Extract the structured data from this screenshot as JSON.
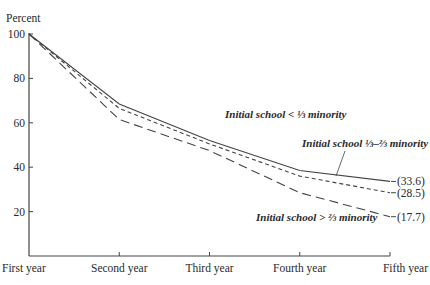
{
  "chart_data": {
    "type": "line",
    "title": "",
    "xlabel": "",
    "ylabel": "Percent",
    "ylim": [
      0,
      100
    ],
    "yticks": [
      20,
      40,
      60,
      80,
      100
    ],
    "ytick_labels": [
      "20",
      "40",
      "60",
      "80",
      "100"
    ],
    "grid": false,
    "categories": [
      "First year",
      "Second year",
      "Third year",
      "Fourth year",
      "Fifth year"
    ],
    "series": [
      {
        "name": "Initial school < 1/3 minority",
        "label": "Initial school < ⅓ minority",
        "style": "solid",
        "values": [
          100,
          68.5,
          52,
          38.5,
          33.6
        ],
        "end_label": "(33.6)"
      },
      {
        "name": "Initial school 1/3–2/3 minority",
        "label": "Initial school ⅓–⅔ minority",
        "style": "short-dash",
        "values": [
          100,
          66.5,
          50.5,
          36,
          28.5
        ],
        "end_label": "(28.5)"
      },
      {
        "name": "Initial school > 2/3 minority",
        "label": "Initial school > ⅔ minority",
        "style": "long-dash",
        "values": [
          100,
          61.5,
          47.5,
          28.5,
          17.7
        ],
        "end_label": "(17.7)"
      }
    ],
    "legend": "inline annotations"
  }
}
